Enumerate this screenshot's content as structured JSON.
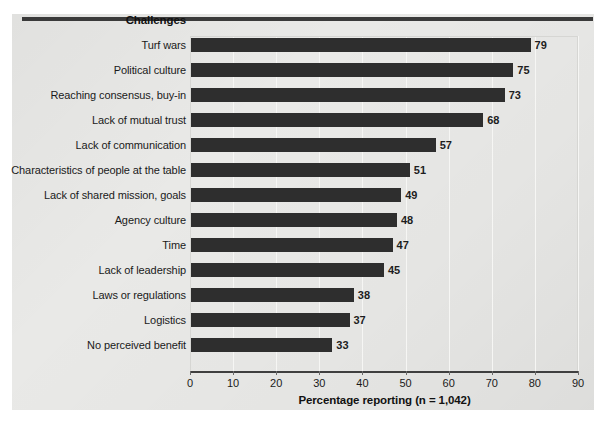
{
  "chart_data": {
    "type": "bar",
    "orientation": "horizontal",
    "title": "",
    "column_header": "Challenges",
    "xlabel": "Percentage reporting (n = 1,042)",
    "ylabel": "",
    "xlim": [
      0,
      90
    ],
    "xticks": [
      0,
      10,
      20,
      30,
      40,
      50,
      60,
      70,
      80,
      90
    ],
    "xtick_labels": [
      "0",
      "10",
      "20",
      "30",
      "40",
      "50",
      "60",
      "70",
      "80",
      "90"
    ],
    "grid": true,
    "grid_axis": "x",
    "legend": false,
    "bar_color": "#2e2e2e",
    "background_color": "#e9e9e7",
    "categories": [
      "Turf wars",
      "Political culture",
      "Reaching consensus, buy-in",
      "Lack of mutual trust",
      "Lack of communication",
      "Characteristics of people at the table",
      "Lack of shared mission, goals",
      "Agency culture",
      "Time",
      "Lack of leadership",
      "Laws or regulations",
      "Logistics",
      "No perceived benefit"
    ],
    "values": [
      79,
      75,
      73,
      68,
      57,
      51,
      49,
      48,
      47,
      45,
      38,
      37,
      33
    ],
    "value_labels": [
      "79",
      "75",
      "73",
      "68",
      "57",
      "51",
      "49",
      "48",
      "47",
      "45",
      "38",
      "37",
      "33"
    ]
  }
}
